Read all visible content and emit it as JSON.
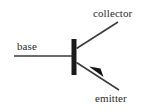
{
  "diagram": {
    "kind": "bipolar-junction-transistor-symbol",
    "background_color": "#ffffff",
    "stroke_color": "#333333",
    "text_color": "#2b2b2b",
    "labels": {
      "collector": "collector",
      "base": "base",
      "emitter": "emitter"
    },
    "parts": {
      "base_lead_name": "base-lead-line",
      "base_bar_name": "base-vertical-bar",
      "collector_lead_name": "collector-lead-line",
      "emitter_lead_name": "emitter-lead-line",
      "emitter_arrow_name": "emitter-arrowhead"
    },
    "geometry": {
      "base_line": {
        "x1": 14,
        "y1": 56,
        "x2": 73,
        "y2": 56
      },
      "base_bar": {
        "x": 72,
        "y": 39,
        "width": 5,
        "height": 36
      },
      "collector_line": {
        "x1": 77,
        "y1": 48,
        "x2": 118,
        "y2": 22
      },
      "emitter_line": {
        "x1": 77,
        "y1": 63,
        "x2": 119,
        "y2": 90
      },
      "emitter_arrow_tip": {
        "x": 90,
        "y": 67
      }
    }
  }
}
